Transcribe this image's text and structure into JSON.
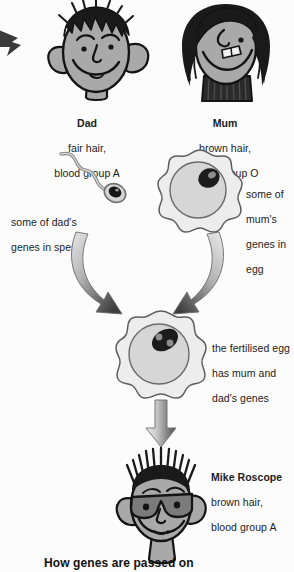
{
  "figure": {
    "title": "How genes are passed on",
    "kind": "genetics-inheritance-diagram"
  },
  "parents": {
    "dad": {
      "name": "Dad",
      "trait_hair": "fair hair,",
      "trait_blood": "blood group A",
      "icon": "dad-face-icon"
    },
    "mum": {
      "name": "Mum",
      "trait_hair": "brown hair,",
      "trait_blood": "blood group O",
      "icon": "mum-face-icon"
    }
  },
  "gametes": {
    "sperm": {
      "label_line1": "some of dad's",
      "label_line2": "genes in sperm",
      "icon": "sperm-cell-icon"
    },
    "egg": {
      "label_line1": "some of",
      "label_line2": "mum's",
      "label_line3": "genes in",
      "label_line4": "egg",
      "icon": "egg-cell-icon"
    }
  },
  "zygote": {
    "label_line1": "the fertilised egg",
    "label_line2": "has mum and",
    "label_line3": "dad's genes",
    "icon": "fertilised-egg-icon"
  },
  "child": {
    "name": "Mike Roscope",
    "trait_hair": "brown hair,",
    "trait_blood": "blood group A",
    "icon": "child-face-icon"
  },
  "arrows": {
    "left_curved": "arrow-sperm-to-zygote",
    "right_curved": "arrow-egg-to-zygote",
    "down_straight": "arrow-zygote-to-child",
    "edge_pointer": "edge-pointer-icon"
  },
  "colors": {
    "skin": "#a9a9a9",
    "hair": "#1a1a1a",
    "outline": "#141414",
    "cell_fill": "#efefef",
    "cell_inner": "#d9d9d9",
    "nucleus": "#1d1d1d",
    "arrow_dark": "#4a4a4a",
    "arrow_light": "#e2e2e2",
    "text": "#1b1b1b",
    "background": "#fcfcfc"
  }
}
